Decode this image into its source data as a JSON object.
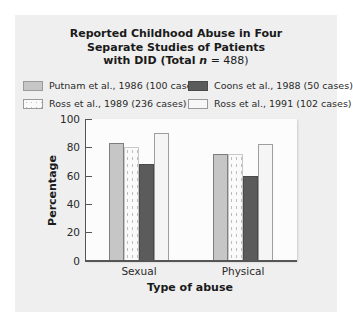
{
  "chart_data": {
    "type": "bar",
    "title_lines": [
      "Reported Childhood Abuse in Four",
      "Separate Studies of Patients",
      "with DID (Total n = 488)"
    ],
    "title": "Reported Childhood Abuse in Four Separate Studies of Patients with DID (Total n = 488)",
    "xlabel": "Type of abuse",
    "ylabel": "Percentage",
    "ylim": [
      0,
      100
    ],
    "yticks": [
      0,
      20,
      40,
      60,
      80,
      100
    ],
    "categories": [
      "Sexual",
      "Physical"
    ],
    "series": [
      {
        "name": "Putnam et al., 1986 (100 cases)",
        "key": "putnam",
        "color": "#c6c6c6",
        "values": [
          83,
          75
        ]
      },
      {
        "name": "Ross et al., 1989 (236 cases)",
        "key": "ross89",
        "color": "#fafafa",
        "pattern": "dotted",
        "values": [
          80,
          75
        ]
      },
      {
        "name": "Coons et al., 1988 (50 cases)",
        "key": "coons",
        "color": "#5b5b5b",
        "values": [
          68,
          60
        ]
      },
      {
        "name": "Ross et al., 1991 (102 cases)",
        "key": "ross91",
        "color": "#f5f5f5",
        "values": [
          90,
          82
        ]
      }
    ],
    "legend_position": "top",
    "grid": false
  },
  "legend": {
    "putnam": "Putnam et al., 1986 (100 cases)",
    "coons": "Coons et al., 1988 (50 cases)",
    "ross89": "Ross et al., 1989 (236 cases)",
    "ross91": "Ross et al., 1991 (102 cases)"
  }
}
